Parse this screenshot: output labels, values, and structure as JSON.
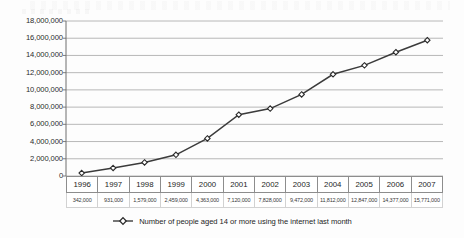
{
  "chart_data": {
    "type": "line",
    "title": "",
    "xlabel": "",
    "ylabel": "",
    "categories": [
      "1996",
      "1997",
      "1998",
      "1999",
      "2000",
      "2001",
      "2002",
      "2003",
      "2004",
      "2005",
      "2006",
      "2007"
    ],
    "values": [
      342000,
      931000,
      1579000,
      2459000,
      4363000,
      7120000,
      7828000,
      9472000,
      11812000,
      12847000,
      14377000,
      15771000
    ],
    "value_labels": [
      "342,000",
      "931,000",
      "1,579,000",
      "2,459,000",
      "4,363,000",
      "7,120,000",
      "7,828,000",
      "9,472,000",
      "11,812,000",
      "12,847,000",
      "14,377,000",
      "15,771,000"
    ],
    "series": [
      {
        "name": "Number of people aged 14 or more using the internet last month",
        "values": [
          342000,
          931000,
          1579000,
          2459000,
          4363000,
          7120000,
          7828000,
          9472000,
          11812000,
          12847000,
          14377000,
          15771000
        ]
      }
    ],
    "ylim": [
      0,
      18000000
    ],
    "y_ticks": [
      0,
      2000000,
      4000000,
      6000000,
      8000000,
      10000000,
      12000000,
      14000000,
      16000000,
      18000000
    ],
    "y_tick_labels": [
      "0",
      "2,000,000",
      "4,000,000",
      "6,000,000",
      "8,000,000",
      "10,000,000",
      "12,000,000",
      "14,000,000",
      "16,000,000",
      "18,000,000"
    ],
    "grid": "horizontal",
    "legend_position": "bottom",
    "marker": "diamond-open",
    "line_color": "#3b3b3b",
    "grid_color": "#b0b0b0",
    "marker_fill": "#ffffff",
    "marker_stroke": "#2a2a2a"
  },
  "legend": {
    "label": "Number of people aged 14 or more using the internet last month",
    "marker_name": "diamond-line-marker"
  },
  "table": {
    "year_row_name": "year-header-row",
    "value_row_name": "value-data-row"
  }
}
